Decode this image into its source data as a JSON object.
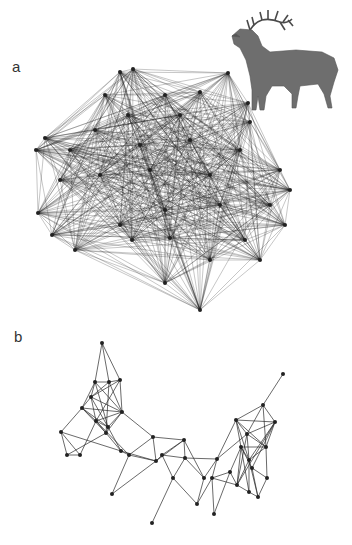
{
  "figure": {
    "panels": [
      {
        "label": "a",
        "description": "dense social network graph with many nodes and edges"
      },
      {
        "label": "b",
        "description": "sparse social network graph with clustered communities"
      }
    ],
    "illustration": {
      "subject": "bugling red deer stag (elk)",
      "name": "elk-illustration"
    },
    "colors": {
      "edge": "#1a1a1a",
      "node": "#222222",
      "background": "#ffffff",
      "deer": "#6b6b6b"
    }
  },
  "network_a": {
    "nodes": [
      [
        120,
        72
      ],
      [
        133,
        69
      ],
      [
        228,
        73
      ],
      [
        105,
        95
      ],
      [
        165,
        95
      ],
      [
        200,
        92
      ],
      [
        248,
        103
      ],
      [
        95,
        130
      ],
      [
        128,
        115
      ],
      [
        180,
        115
      ],
      [
        250,
        122
      ],
      [
        45,
        138
      ],
      [
        36,
        150
      ],
      [
        70,
        150
      ],
      [
        140,
        145
      ],
      [
        190,
        140
      ],
      [
        240,
        150
      ],
      [
        280,
        170
      ],
      [
        60,
        180
      ],
      [
        100,
        175
      ],
      [
        150,
        170
      ],
      [
        210,
        175
      ],
      [
        290,
        190
      ],
      [
        38,
        213
      ],
      [
        52,
        235
      ],
      [
        75,
        250
      ],
      [
        120,
        225
      ],
      [
        165,
        210
      ],
      [
        220,
        205
      ],
      [
        270,
        205
      ],
      [
        132,
        240
      ],
      [
        170,
        238
      ],
      [
        245,
        240
      ],
      [
        285,
        225
      ],
      [
        165,
        283
      ],
      [
        200,
        310
      ],
      [
        210,
        260
      ],
      [
        260,
        260
      ]
    ]
  },
  "network_b": {
    "nodes": [
      [
        102,
        343
      ],
      [
        95,
        382
      ],
      [
        109,
        382
      ],
      [
        120,
        380
      ],
      [
        91,
        397
      ],
      [
        82,
        408
      ],
      [
        122,
        412
      ],
      [
        96,
        421
      ],
      [
        108,
        427
      ],
      [
        106,
        433
      ],
      [
        61,
        432
      ],
      [
        67,
        455
      ],
      [
        80,
        455
      ],
      [
        121,
        451
      ],
      [
        129,
        455
      ],
      [
        153,
        437
      ],
      [
        156,
        461
      ],
      [
        112,
        494
      ],
      [
        184,
        440
      ],
      [
        185,
        458
      ],
      [
        173,
        478
      ],
      [
        152,
        523
      ],
      [
        204,
        478
      ],
      [
        162,
        455
      ],
      [
        197,
        504
      ],
      [
        217,
        459
      ],
      [
        212,
        478
      ],
      [
        236,
        420
      ],
      [
        247,
        434
      ],
      [
        263,
        405
      ],
      [
        283,
        374
      ],
      [
        275,
        422
      ],
      [
        266,
        447
      ],
      [
        241,
        447
      ],
      [
        237,
        485
      ],
      [
        249,
        492
      ],
      [
        258,
        497
      ],
      [
        267,
        478
      ],
      [
        249,
        460
      ],
      [
        230,
        472
      ],
      [
        214,
        514
      ],
      [
        252,
        468
      ]
    ],
    "edges": [
      [
        0,
        1
      ],
      [
        0,
        2
      ],
      [
        0,
        3
      ],
      [
        1,
        2
      ],
      [
        2,
        3
      ],
      [
        1,
        4
      ],
      [
        1,
        5
      ],
      [
        1,
        6
      ],
      [
        2,
        4
      ],
      [
        2,
        6
      ],
      [
        3,
        6
      ],
      [
        4,
        5
      ],
      [
        4,
        6
      ],
      [
        4,
        7
      ],
      [
        4,
        8
      ],
      [
        5,
        6
      ],
      [
        5,
        7
      ],
      [
        5,
        8
      ],
      [
        5,
        9
      ],
      [
        6,
        7
      ],
      [
        6,
        8
      ],
      [
        6,
        9
      ],
      [
        7,
        8
      ],
      [
        7,
        9
      ],
      [
        8,
        9
      ],
      [
        3,
        4
      ],
      [
        3,
        7
      ],
      [
        1,
        8
      ],
      [
        2,
        9
      ],
      [
        5,
        10
      ],
      [
        10,
        11
      ],
      [
        10,
        12
      ],
      [
        11,
        12
      ],
      [
        10,
        13
      ],
      [
        12,
        7
      ],
      [
        11,
        9
      ],
      [
        9,
        13
      ],
      [
        8,
        13
      ],
      [
        13,
        14
      ],
      [
        7,
        14
      ],
      [
        6,
        15
      ],
      [
        14,
        15
      ],
      [
        14,
        16
      ],
      [
        13,
        16
      ],
      [
        14,
        17
      ],
      [
        16,
        17
      ],
      [
        15,
        16
      ],
      [
        15,
        18
      ],
      [
        16,
        18
      ],
      [
        18,
        19
      ],
      [
        18,
        23
      ],
      [
        19,
        23
      ],
      [
        16,
        23
      ],
      [
        19,
        20
      ],
      [
        20,
        21
      ],
      [
        18,
        22
      ],
      [
        19,
        22
      ],
      [
        23,
        20
      ],
      [
        22,
        24
      ],
      [
        20,
        24
      ],
      [
        22,
        25
      ],
      [
        19,
        25
      ],
      [
        24,
        26
      ],
      [
        25,
        26
      ],
      [
        25,
        27
      ],
      [
        25,
        28
      ],
      [
        27,
        28
      ],
      [
        27,
        29
      ],
      [
        28,
        29
      ],
      [
        29,
        30
      ],
      [
        28,
        31
      ],
      [
        27,
        31
      ],
      [
        31,
        32
      ],
      [
        28,
        32
      ],
      [
        27,
        33
      ],
      [
        33,
        32
      ],
      [
        33,
        34
      ],
      [
        33,
        35
      ],
      [
        34,
        35
      ],
      [
        35,
        36
      ],
      [
        36,
        37
      ],
      [
        37,
        32
      ],
      [
        33,
        38
      ],
      [
        38,
        32
      ],
      [
        31,
        38
      ],
      [
        34,
        38
      ],
      [
        35,
        38
      ],
      [
        36,
        38
      ],
      [
        39,
        33
      ],
      [
        39,
        26
      ],
      [
        39,
        34
      ],
      [
        26,
        34
      ],
      [
        26,
        40
      ],
      [
        39,
        40
      ],
      [
        41,
        36
      ],
      [
        41,
        37
      ],
      [
        41,
        31
      ],
      [
        41,
        33
      ],
      [
        28,
        38
      ],
      [
        27,
        32
      ],
      [
        29,
        31
      ],
      [
        28,
        34
      ],
      [
        31,
        34
      ],
      [
        27,
        38
      ],
      [
        29,
        32
      ]
    ]
  }
}
